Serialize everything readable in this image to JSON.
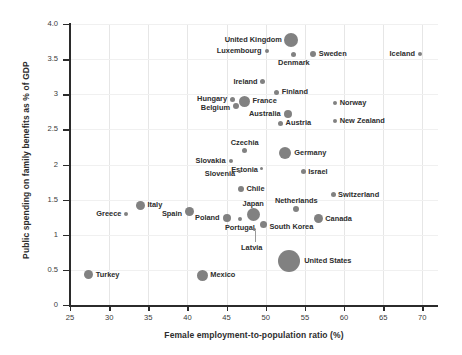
{
  "chart_data": {
    "type": "scatter",
    "title": "",
    "xlabel": "Female employment-to-population ratio (%)",
    "ylabel": "Public spending on family benefits as % of GDP",
    "xlim": [
      25,
      72
    ],
    "ylim": [
      0,
      4.0
    ],
    "xticks": [
      "25",
      "30",
      "35",
      "40",
      "45",
      "50",
      "55",
      "60",
      "65",
      "70"
    ],
    "xtick_values": [
      25,
      30,
      35,
      40,
      45,
      50,
      55,
      60,
      65,
      70
    ],
    "yticks": [
      "0",
      "0.5",
      "1",
      "1.5",
      "2",
      "2.5",
      "3",
      "3.5",
      "4.0"
    ],
    "ytick_values": [
      0,
      0.5,
      1,
      1.5,
      2,
      2.5,
      3,
      3.5,
      4
    ],
    "grid": "both",
    "legend": "none",
    "bubble_size_encodes": "population",
    "marker_color": "#7a7a7a",
    "points": [
      {
        "label": "United Kingdom",
        "x": 53.2,
        "y": 3.77,
        "size": 14,
        "label_pos": "left",
        "dx": -9,
        "dy": 0
      },
      {
        "label": "Luxembourg",
        "x": 50.1,
        "y": 3.62,
        "size": 4,
        "label_pos": "left",
        "dx": -5,
        "dy": 0
      },
      {
        "label": "Denmark",
        "x": 53.6,
        "y": 3.56,
        "size": 5,
        "label_pos": "below",
        "dx": 0,
        "dy": 4
      },
      {
        "label": "Sweden",
        "x": 56.0,
        "y": 3.58,
        "size": 6,
        "label_pos": "right",
        "dx": 6,
        "dy": 0
      },
      {
        "label": "Iceland",
        "x": 69.7,
        "y": 3.58,
        "size": 4,
        "label_pos": "left",
        "dx": -5,
        "dy": 0
      },
      {
        "label": "Ireland",
        "x": 49.6,
        "y": 3.18,
        "size": 5,
        "label_pos": "left",
        "dx": -5,
        "dy": 0
      },
      {
        "label": "Finland",
        "x": 51.4,
        "y": 3.03,
        "size": 5,
        "label_pos": "right",
        "dx": 5,
        "dy": 0
      },
      {
        "label": "Hungary",
        "x": 45.7,
        "y": 2.93,
        "size": 5,
        "label_pos": "left",
        "dx": -5,
        "dy": 0
      },
      {
        "label": "France",
        "x": 47.3,
        "y": 2.9,
        "size": 11,
        "label_pos": "right",
        "dx": 8,
        "dy": 0
      },
      {
        "label": "Belgium",
        "x": 46.2,
        "y": 2.83,
        "size": 6,
        "label_pos": "left",
        "dx": -6,
        "dy": 2
      },
      {
        "label": "Norway",
        "x": 58.8,
        "y": 2.88,
        "size": 4,
        "label_pos": "right",
        "dx": 5,
        "dy": 0
      },
      {
        "label": "Australia",
        "x": 52.8,
        "y": 2.72,
        "size": 8,
        "label_pos": "left",
        "dx": -7,
        "dy": 0
      },
      {
        "label": "New Zealand",
        "x": 58.8,
        "y": 2.62,
        "size": 4,
        "label_pos": "right",
        "dx": 5,
        "dy": 0
      },
      {
        "label": "Austria",
        "x": 51.9,
        "y": 2.59,
        "size": 5,
        "label_pos": "right",
        "dx": 5,
        "dy": 0
      },
      {
        "label": "Czechia",
        "x": 47.3,
        "y": 2.2,
        "size": 5,
        "label_pos": "above",
        "dx": 0,
        "dy": -4
      },
      {
        "label": "Germany",
        "x": 52.5,
        "y": 2.17,
        "size": 12,
        "label_pos": "right",
        "dx": 9,
        "dy": 0
      },
      {
        "label": "Slovakia",
        "x": 45.5,
        "y": 2.05,
        "size": 4,
        "label_pos": "left",
        "dx": -5,
        "dy": 0
      },
      {
        "label": "Estonia",
        "x": 49.5,
        "y": 1.95,
        "size": 3,
        "label_pos": "left",
        "dx": -4,
        "dy": 2
      },
      {
        "label": "Israel",
        "x": 54.8,
        "y": 1.9,
        "size": 5,
        "label_pos": "right",
        "dx": 5,
        "dy": 0
      },
      {
        "label": "Slovenia",
        "x": 46.6,
        "y": 1.9,
        "size": 3,
        "label_pos": "left",
        "dx": -4,
        "dy": 2
      },
      {
        "label": "Switzerland",
        "x": 58.6,
        "y": 1.57,
        "size": 5,
        "label_pos": "right",
        "dx": 5,
        "dy": 0
      },
      {
        "label": "Chile",
        "x": 46.9,
        "y": 1.65,
        "size": 6,
        "label_pos": "right",
        "dx": 5,
        "dy": 0
      },
      {
        "label": "Netherlands",
        "x": 53.9,
        "y": 1.37,
        "size": 6,
        "label_pos": "above",
        "dx": 0,
        "dy": -5
      },
      {
        "label": "Italy",
        "x": 34.0,
        "y": 1.42,
        "size": 9,
        "label_pos": "right",
        "dx": 7,
        "dy": 0
      },
      {
        "label": "Greece",
        "x": 32.2,
        "y": 1.29,
        "size": 4,
        "label_pos": "left",
        "dx": -5,
        "dy": 0
      },
      {
        "label": "Spain",
        "x": 40.2,
        "y": 1.33,
        "size": 9,
        "label_pos": "left",
        "dx": -7,
        "dy": 2
      },
      {
        "label": "Japan",
        "x": 48.4,
        "y": 1.29,
        "size": 13,
        "label_pos": "above",
        "dx": 0,
        "dy": -7
      },
      {
        "label": "Poland",
        "x": 45.0,
        "y": 1.24,
        "size": 8,
        "label_pos": "left",
        "dx": -7,
        "dy": 0
      },
      {
        "label": "Canada",
        "x": 56.7,
        "y": 1.23,
        "size": 9,
        "label_pos": "right",
        "dx": 7,
        "dy": 0
      },
      {
        "label": "Portugal",
        "x": 46.7,
        "y": 1.22,
        "size": 4,
        "label_pos": "below",
        "dx": 0,
        "dy": 5
      },
      {
        "label": "South Korea",
        "x": 49.7,
        "y": 1.14,
        "size": 7,
        "label_pos": "right",
        "dx": 6,
        "dy": 2
      },
      {
        "label": "Latvia",
        "x": 48.6,
        "y": 1.07,
        "size": 3,
        "label_pos": "below",
        "dx": -3,
        "dy": 14
      },
      {
        "label": "United States",
        "x": 53.0,
        "y": 0.63,
        "size": 22,
        "label_pos": "right",
        "dx": 15,
        "dy": 0
      },
      {
        "label": "Mexico",
        "x": 41.9,
        "y": 0.42,
        "size": 11,
        "label_pos": "right",
        "dx": 8,
        "dy": 0
      },
      {
        "label": "Turkey",
        "x": 27.4,
        "y": 0.43,
        "size": 9,
        "label_pos": "right",
        "dx": 7,
        "dy": 0
      }
    ]
  }
}
